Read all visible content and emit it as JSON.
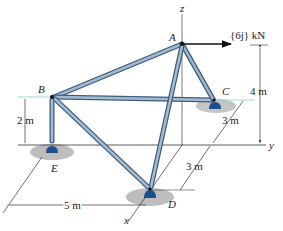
{
  "figure": {
    "axes": {
      "x": "x",
      "y": "y",
      "z": "z"
    },
    "joints": {
      "A": "A",
      "B": "B",
      "C": "C",
      "D": "D",
      "E": "E"
    },
    "load": {
      "label": "{6j} kN",
      "bold_part": "j"
    },
    "dimensions": {
      "height_A": "4 m",
      "height_B": "2 m",
      "x_CD_upper": "3 m",
      "x_CD_lower": "3 m",
      "width_E": "5 m"
    },
    "members": [
      "AB",
      "AC",
      "AD",
      "BC",
      "BD",
      "BE"
    ],
    "colors": {
      "member": "#6f8fb0",
      "member_dark": "#3e5c7c",
      "support": "#1f4f8a",
      "ground": "#bfbfbf",
      "axis": "#333333",
      "guide": "#7fd0d8"
    }
  }
}
